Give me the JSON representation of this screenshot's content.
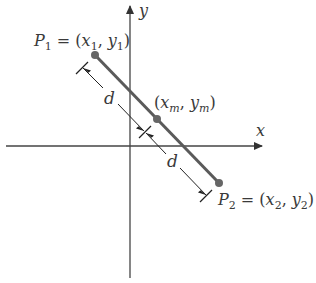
{
  "diagram": {
    "axes": {
      "x_label": "x",
      "y_label": "y"
    },
    "points": {
      "p1": {
        "name": "P",
        "sub": "1",
        "eq": " = (",
        "x": "x",
        "xsub": "1",
        "comma": ", ",
        "y": "y",
        "ysub": "1",
        "close": ")"
      },
      "mid": {
        "open": "(",
        "x": "x",
        "xsub": "m",
        "comma": ", ",
        "y": "y",
        "ysub": "m",
        "close": ")"
      },
      "p2": {
        "name": "P",
        "sub": "2",
        "eq": " = (",
        "x": "x",
        "xsub": "2",
        "comma": ", ",
        "y": "y",
        "ysub": "2",
        "close": ")"
      }
    },
    "distance_labels": [
      "d",
      "d"
    ],
    "colors": {
      "axis": "#444444",
      "segment": "#555555",
      "point": "#666666",
      "text": "#3a3a3a"
    }
  }
}
